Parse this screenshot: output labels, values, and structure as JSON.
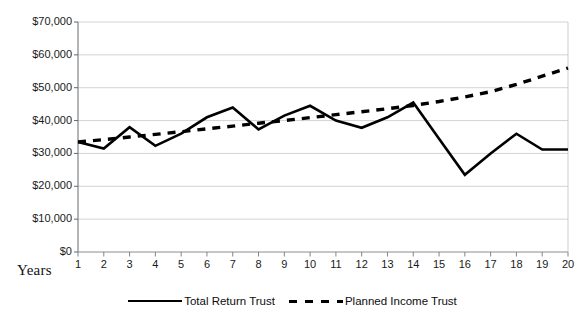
{
  "chart_data": {
    "type": "line",
    "title": "",
    "xlabel": "Years",
    "ylabel": "",
    "x": [
      1,
      2,
      3,
      4,
      5,
      6,
      7,
      8,
      9,
      10,
      11,
      12,
      13,
      14,
      15,
      16,
      17,
      18,
      19,
      20
    ],
    "xtick_labels": [
      "1",
      "2",
      "3",
      "4",
      "5",
      "6",
      "7",
      "8",
      "9",
      "10",
      "11",
      "12",
      "13",
      "14",
      "15",
      "16",
      "17",
      "18",
      "19",
      "20"
    ],
    "ytick_labels": [
      "$0",
      "$10,000",
      "$20,000",
      "$30,000",
      "$40,000",
      "$50,000",
      "$60,000",
      "$70,000"
    ],
    "ytick_values": [
      0,
      10000,
      20000,
      30000,
      40000,
      50000,
      60000,
      70000
    ],
    "ylim": [
      0,
      70000
    ],
    "xlim": [
      1,
      20
    ],
    "grid": true,
    "grid_axis": "y",
    "legend_position": "bottom",
    "series": [
      {
        "name": "Total Return Trust",
        "style": "solid",
        "color": "#000000",
        "values": [
          33500,
          31500,
          38000,
          32300,
          36000,
          41000,
          44000,
          37300,
          41500,
          44500,
          40000,
          37800,
          41000,
          45500,
          34500,
          23500,
          30000,
          36000,
          31200,
          31200
        ]
      },
      {
        "name": "Planned Income Trust",
        "style": "dashed",
        "color": "#000000",
        "values": [
          33500,
          34200,
          35000,
          35800,
          36600,
          37500,
          38300,
          39200,
          40000,
          40900,
          41800,
          42700,
          43600,
          44600,
          45800,
          47200,
          48800,
          51000,
          53500,
          56000
        ]
      }
    ]
  },
  "legend": {
    "entries": [
      {
        "label": "Total Return Trust",
        "style": "solid"
      },
      {
        "label": "Planned Income Trust",
        "style": "dashed"
      }
    ]
  },
  "axis_titles": {
    "x": "Years"
  },
  "colors": {
    "line": "#000000",
    "grid": "#c8c8c8",
    "axis": "#6f6f6f",
    "background": "#ffffff"
  }
}
